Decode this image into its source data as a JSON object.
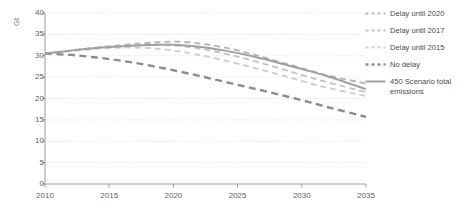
{
  "chart_data": {
    "type": "line",
    "title": "",
    "subtitle": "",
    "xlabel": "",
    "ylabel": "Gt",
    "unit_label": "Gt",
    "xlim": [
      2010,
      2035
    ],
    "ylim": [
      0,
      40
    ],
    "xticks": [
      2010,
      2015,
      2020,
      2025,
      2030,
      2035
    ],
    "yticks": [
      0,
      5,
      10,
      15,
      20,
      25,
      30,
      35,
      40
    ],
    "xtick_labels": [
      "2010",
      "2015",
      "2020",
      "2025",
      "2030",
      "2035"
    ],
    "ytick_labels": [
      "0",
      "5",
      "10",
      "15",
      "20",
      "25",
      "30",
      "35",
      "40"
    ],
    "grid": "horizontal-dotted",
    "legend_position": "right",
    "x": [
      2010,
      2012,
      2014,
      2016,
      2018,
      2020,
      2022,
      2024,
      2026,
      2028,
      2030,
      2032,
      2035
    ],
    "series": [
      {
        "name": "Delay until 2020",
        "style": "dashed",
        "color": "#b5b5b5",
        "values": [
          30.5,
          31.2,
          31.9,
          32.5,
          33.0,
          33.3,
          32.9,
          31.9,
          30.5,
          28.8,
          27.1,
          25.4,
          23.5
        ]
      },
      {
        "name": "Delay until 2017",
        "style": "dashed",
        "color": "#c4c4c4",
        "values": [
          30.5,
          31.2,
          31.8,
          32.3,
          32.6,
          32.4,
          31.7,
          30.5,
          29.0,
          27.3,
          25.5,
          23.8,
          21.5
        ]
      },
      {
        "name": "Delay until 2015",
        "style": "dashed",
        "color": "#cfcfcf",
        "values": [
          30.5,
          31.1,
          31.6,
          31.9,
          31.8,
          31.2,
          30.2,
          28.9,
          27.4,
          25.8,
          24.1,
          22.5,
          20.6
        ]
      },
      {
        "name": "No delay",
        "style": "dashed-bold",
        "color": "#8c8c8c",
        "values": [
          30.5,
          30.2,
          29.6,
          28.8,
          27.8,
          26.6,
          25.3,
          23.9,
          22.5,
          21.1,
          19.6,
          18.0,
          15.7
        ]
      },
      {
        "name": "450 Scenario total\nemissions",
        "style": "solid",
        "color": "#a0a0a0",
        "values": [
          30.5,
          31.2,
          31.8,
          32.2,
          32.5,
          32.6,
          32.1,
          31.2,
          30.0,
          28.5,
          26.9,
          25.2,
          22.2
        ]
      }
    ],
    "colors": {
      "axis": "#9a9a9a",
      "grid": "#d8d8d8",
      "tick_text": "#636363",
      "legend_text": "#4a4a4a"
    }
  }
}
